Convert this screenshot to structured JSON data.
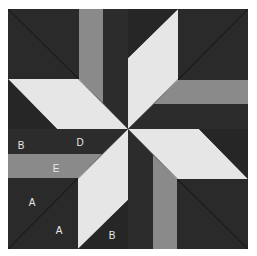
{
  "diagram": {
    "type": "quilt-block",
    "title": "",
    "colors": {
      "background": "#ffffff",
      "dark": "#2a2a2a",
      "medium": "#8a8a8a",
      "light": "#e6e6e6",
      "seam": "#111111",
      "label": "#e8e8e8"
    },
    "labels": [
      {
        "text": "B",
        "x": 21,
        "y": 145
      },
      {
        "text": "D",
        "x": 80,
        "y": 142
      },
      {
        "text": "E",
        "x": 56,
        "y": 168
      },
      {
        "text": "A",
        "x": 32,
        "y": 202
      },
      {
        "text": "C",
        "x": 106,
        "y": 189
      },
      {
        "text": "A",
        "x": 59,
        "y": 230
      },
      {
        "text": "B",
        "x": 112,
        "y": 235
      }
    ]
  }
}
